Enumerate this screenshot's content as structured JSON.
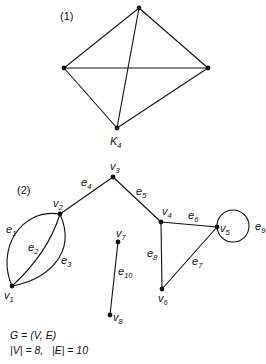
{
  "figure1": {
    "label": "(1)",
    "graph_name": "K",
    "graph_name_sub": "4"
  },
  "figure2": {
    "label": "(2)",
    "vertices": [
      {
        "id": "v1",
        "name": "v",
        "sub": "1"
      },
      {
        "id": "v2",
        "name": "v",
        "sub": "2"
      },
      {
        "id": "v3",
        "name": "v",
        "sub": "3"
      },
      {
        "id": "v4",
        "name": "v",
        "sub": "4"
      },
      {
        "id": "v5",
        "name": "v",
        "sub": "5"
      },
      {
        "id": "v6",
        "name": "v",
        "sub": "6"
      },
      {
        "id": "v7",
        "name": "v",
        "sub": "7"
      },
      {
        "id": "v8",
        "name": "v",
        "sub": "8"
      }
    ],
    "edges": [
      {
        "id": "e1",
        "name": "e",
        "sub": "1",
        "from": "v1",
        "to": "v2"
      },
      {
        "id": "e2",
        "name": "e",
        "sub": "2",
        "from": "v1",
        "to": "v2"
      },
      {
        "id": "e3",
        "name": "e",
        "sub": "3",
        "from": "v1",
        "to": "v2"
      },
      {
        "id": "e4",
        "name": "e",
        "sub": "4",
        "from": "v2",
        "to": "v3"
      },
      {
        "id": "e5",
        "name": "e",
        "sub": "5",
        "from": "v3",
        "to": "v4"
      },
      {
        "id": "e6",
        "name": "e",
        "sub": "6",
        "from": "v4",
        "to": "v5"
      },
      {
        "id": "e7",
        "name": "e",
        "sub": "7",
        "from": "v5",
        "to": "v6"
      },
      {
        "id": "e8",
        "name": "e",
        "sub": "8",
        "from": "v4",
        "to": "v6"
      },
      {
        "id": "e9",
        "name": "e",
        "sub": "9",
        "from": "v5",
        "to": "v5"
      },
      {
        "id": "e10",
        "name": "e",
        "sub": "10",
        "from": "v7",
        "to": "v8"
      }
    ]
  },
  "footer": {
    "line1": "G = (V, E)",
    "line2": "|V| = 8,   |E| = 10"
  }
}
